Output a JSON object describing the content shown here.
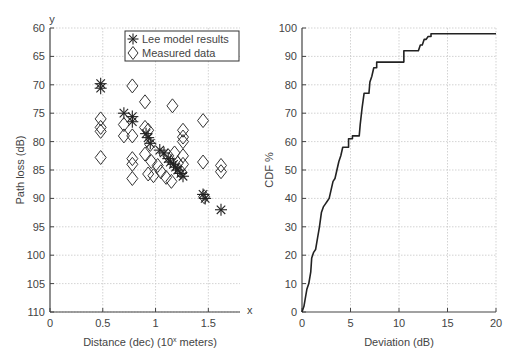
{
  "chart_data": [
    {
      "type": "scatter",
      "title": "",
      "xlabel": "Distance (dec) (10^x meters)",
      "xlabel_display": "Distance (dec) (10",
      "xlabel_sup": "x",
      "xlabel_tail": " meters)",
      "ylabel": "Path loss (dB)",
      "x_axis_letter": "x",
      "y_axis_letter": "y",
      "xlim": [
        0,
        1.8
      ],
      "ylim": [
        110,
        60
      ],
      "y_inverted": true,
      "grid": true,
      "xticks": [
        0,
        0.5,
        1,
        1.5
      ],
      "xtick_labels": [
        "0",
        "0.5",
        "1",
        "1.5"
      ],
      "yticks": [
        60,
        65,
        70,
        75,
        80,
        85,
        90,
        95,
        100,
        105,
        110
      ],
      "ytick_labels": [
        "60",
        "65",
        "70",
        "75",
        "80",
        "85",
        "90",
        "95",
        "100",
        "105",
        "110"
      ],
      "legend": {
        "position": "upper right",
        "entries": [
          "Lee model results",
          "Measured data"
        ]
      },
      "series": [
        {
          "name": "Lee model results",
          "marker": "asterisk",
          "points": [
            [
              0.48,
              69.8
            ],
            [
              0.48,
              70.6
            ],
            [
              0.7,
              75.0
            ],
            [
              0.78,
              75.6
            ],
            [
              0.78,
              76.5
            ],
            [
              0.91,
              78.6
            ],
            [
              0.93,
              79.3
            ],
            [
              0.95,
              80.3
            ],
            [
              1.04,
              81.5
            ],
            [
              1.08,
              82.0
            ],
            [
              1.12,
              83.0
            ],
            [
              1.14,
              83.6
            ],
            [
              1.17,
              84.0
            ],
            [
              1.19,
              84.5
            ],
            [
              1.21,
              85.0
            ],
            [
              1.24,
              85.6
            ],
            [
              1.26,
              86.1
            ],
            [
              1.45,
              89.3
            ],
            [
              1.47,
              90.0
            ],
            [
              1.62,
              92.0
            ]
          ]
        },
        {
          "name": "Measured data",
          "marker": "diamond",
          "points": [
            [
              0.48,
              76.0
            ],
            [
              0.48,
              77.5
            ],
            [
              0.48,
              78.2
            ],
            [
              0.48,
              82.8
            ],
            [
              0.78,
              70.2
            ],
            [
              0.7,
              77.0
            ],
            [
              0.7,
              79.0
            ],
            [
              0.78,
              79.0
            ],
            [
              0.78,
              83.0
            ],
            [
              0.78,
              84.0
            ],
            [
              0.78,
              86.5
            ],
            [
              0.9,
              73.0
            ],
            [
              0.9,
              77.5
            ],
            [
              0.93,
              78.0
            ],
            [
              0.95,
              80.5
            ],
            [
              0.9,
              82.2
            ],
            [
              0.96,
              83.5
            ],
            [
              0.93,
              85.7
            ],
            [
              0.98,
              86.0
            ],
            [
              1.02,
              84.2
            ],
            [
              1.05,
              85.3
            ],
            [
              1.1,
              86.3
            ],
            [
              1.15,
              87.0
            ],
            [
              1.12,
              82.5
            ],
            [
              1.18,
              82.0
            ],
            [
              1.21,
              83.8
            ],
            [
              1.24,
              85.3
            ],
            [
              1.16,
              73.7
            ],
            [
              1.26,
              78.0
            ],
            [
              1.26,
              79.2
            ],
            [
              1.26,
              80.0
            ],
            [
              1.26,
              82.5
            ],
            [
              1.26,
              84.0
            ],
            [
              1.45,
              76.3
            ],
            [
              1.45,
              83.6
            ],
            [
              1.46,
              89.7
            ],
            [
              1.62,
              84.2
            ],
            [
              1.62,
              85.3
            ]
          ]
        }
      ]
    },
    {
      "type": "line",
      "title": "",
      "xlabel": "Deviation (dB)",
      "ylabel": "CDF %",
      "xlim": [
        0,
        20
      ],
      "ylim": [
        0,
        100
      ],
      "grid": true,
      "xticks": [
        0,
        5,
        10,
        15,
        20
      ],
      "xtick_labels": [
        "0",
        "5",
        "10",
        "15",
        "20"
      ],
      "yticks": [
        0,
        10,
        20,
        30,
        40,
        50,
        60,
        70,
        80,
        90,
        100
      ],
      "ytick_labels": [
        "0",
        "10",
        "20",
        "30",
        "40",
        "50",
        "60",
        "70",
        "80",
        "90",
        "100"
      ],
      "series": [
        {
          "name": "CDF",
          "step": true,
          "x": [
            0,
            0.2,
            0.3,
            0.5,
            0.7,
            0.9,
            1.0,
            1.2,
            1.4,
            1.6,
            1.8,
            2.0,
            2.2,
            2.4,
            2.6,
            2.8,
            3.0,
            3.2,
            3.4,
            3.6,
            3.8,
            4.0,
            4.2,
            4.5,
            4.8,
            5.2,
            5.4,
            5.9,
            6.0,
            6.2,
            6.4,
            6.9,
            7.0,
            7.2,
            7.4,
            7.7,
            8.0,
            8.2,
            9.0,
            10.0,
            10.5,
            11.0,
            12.0,
            12.2,
            12.4,
            12.6,
            12.8,
            13.0,
            13.3,
            15.0,
            20.0
          ],
          "values": [
            0,
            2,
            4,
            8,
            10,
            14,
            19,
            21,
            22,
            26,
            30,
            35,
            37,
            38,
            39,
            40,
            43,
            46,
            47,
            50,
            53,
            55,
            58,
            58,
            61,
            62,
            62,
            62,
            66,
            72,
            77,
            77,
            81,
            83,
            86,
            88,
            88,
            88,
            88,
            88,
            92,
            92,
            92,
            94,
            94,
            96,
            96,
            97,
            98,
            98,
            98
          ]
        }
      ]
    }
  ]
}
